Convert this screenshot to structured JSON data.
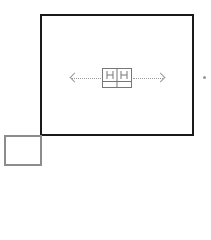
{
  "diagram": {
    "main_frame": {
      "border_color": "#1a1a1a"
    },
    "small_frame": {
      "border_color": "#8c8c8c"
    },
    "connector": {
      "color": "#9a9a9a",
      "style": "dotted",
      "direction": "bidirectional-horizontal"
    },
    "icons": {
      "left_arrow": "chevron-left-icon",
      "right_arrow": "chevron-right-icon",
      "center": "component-block-icon",
      "edge": "offscreen-indicator-icon"
    }
  }
}
